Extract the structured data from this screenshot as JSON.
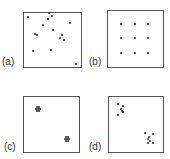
{
  "panels": [
    {
      "id": "a",
      "label": "(a)",
      "description": "random pattern",
      "box": {
        "x": 23,
        "y": 12,
        "w": 59,
        "h": 56
      },
      "label_pos": {
        "x": 2,
        "y": 57
      },
      "points": [
        [
          28,
          17
        ],
        [
          49,
          13
        ],
        [
          52,
          16
        ],
        [
          48,
          19
        ],
        [
          43,
          25
        ],
        [
          70,
          23
        ],
        [
          53,
          30
        ],
        [
          35,
          34
        ],
        [
          37,
          35
        ],
        [
          62,
          35
        ],
        [
          60,
          38
        ],
        [
          64,
          40
        ],
        [
          33,
          51
        ],
        [
          51,
          50
        ],
        [
          76,
          64
        ]
      ]
    },
    {
      "id": "b",
      "label": "(b)",
      "description": "regular pattern",
      "box": {
        "x": 107,
        "y": 10,
        "w": 57,
        "h": 58
      },
      "label_pos": {
        "x": 89,
        "y": 57
      },
      "points": [
        [
          121,
          24
        ],
        [
          135,
          24
        ],
        [
          148,
          24
        ],
        [
          121,
          38
        ],
        [
          135,
          38
        ],
        [
          148,
          38
        ],
        [
          121,
          53
        ],
        [
          135,
          53
        ],
        [
          148,
          53
        ]
      ]
    },
    {
      "id": "c",
      "label": "(c)",
      "description": "tightly clustered pattern",
      "box": {
        "x": 23,
        "y": 96,
        "w": 57,
        "h": 57
      },
      "label_pos": {
        "x": 4,
        "y": 142
      },
      "points": [
        [
          37,
          107
        ],
        [
          39,
          107
        ],
        [
          36,
          109
        ],
        [
          38,
          109
        ],
        [
          40,
          109
        ],
        [
          37,
          111
        ],
        [
          39,
          111
        ],
        [
          66,
          137
        ],
        [
          68,
          137
        ],
        [
          65,
          139
        ],
        [
          67,
          139
        ],
        [
          69,
          139
        ],
        [
          66,
          141
        ],
        [
          68,
          141
        ]
      ]
    },
    {
      "id": "d",
      "label": "(d)",
      "description": "loosely clustered pattern",
      "box": {
        "x": 108,
        "y": 96,
        "w": 56,
        "h": 57
      },
      "label_pos": {
        "x": 89,
        "y": 142
      },
      "points": [
        [
          118,
          104
        ],
        [
          123,
          106
        ],
        [
          121,
          109
        ],
        [
          122,
          111
        ],
        [
          123,
          112
        ],
        [
          118,
          115
        ],
        [
          145,
          133
        ],
        [
          149,
          137
        ],
        [
          153,
          134
        ],
        [
          148,
          139
        ],
        [
          150,
          141
        ],
        [
          148,
          143
        ],
        [
          153,
          143
        ]
      ]
    }
  ]
}
